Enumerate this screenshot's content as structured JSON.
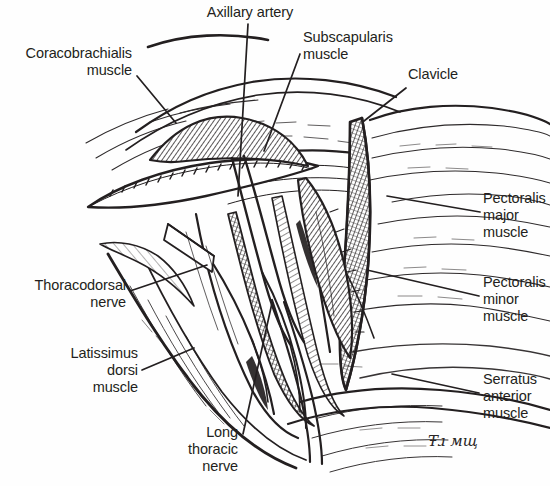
{
  "figure": {
    "type": "line-art-medical-illustration",
    "background_color": "#fefefe",
    "ink_color": "#231f20",
    "width": 550,
    "height": 486
  },
  "labels": [
    {
      "id": "axillary-artery",
      "text": "Axillary artery",
      "align": "center",
      "x": 190,
      "y": 4,
      "width": 120,
      "leader": [
        [
          248,
          24
        ],
        [
          238,
          196
        ]
      ]
    },
    {
      "id": "coracobrachialis-muscle",
      "text": "Coracobrachialis\nmuscle",
      "align": "right",
      "x": 4,
      "y": 45,
      "width": 128,
      "leader": [
        [
          137,
          76
        ],
        [
          176,
          123
        ]
      ]
    },
    {
      "id": "subscapularis-muscle",
      "text": "Subscapularis\nmuscle",
      "align": "left",
      "x": 303,
      "y": 29,
      "width": 110,
      "leader": [
        [
          300,
          54
        ],
        [
          264,
          151
        ]
      ]
    },
    {
      "id": "clavicle",
      "text": "Clavicle",
      "align": "left",
      "x": 408,
      "y": 66,
      "width": 70,
      "leader": [
        [
          406,
          88
        ],
        [
          364,
          121
        ]
      ]
    },
    {
      "id": "pectoralis-major-muscle",
      "text": "Pectoralis\nmajor\nmuscle",
      "align": "left",
      "x": 483,
      "y": 190,
      "width": 70,
      "leader": [
        [
          480,
          212
        ],
        [
          387,
          196
        ]
      ]
    },
    {
      "id": "thoracodorsal-nerve",
      "text": "Thoracodorsal\nnerve",
      "align": "right",
      "x": 4,
      "y": 277,
      "width": 122,
      "leader": [
        [
          130,
          291
        ],
        [
          207,
          265
        ]
      ]
    },
    {
      "id": "pectoralis-minor-muscle",
      "text": "Pectoralis\nminor\nmuscle",
      "align": "left",
      "x": 483,
      "y": 274,
      "width": 68,
      "leader": [
        [
          479,
          296
        ],
        [
          367,
          270
        ]
      ]
    },
    {
      "id": "latissimus-dorsi-muscle",
      "text": "Latissimus\ndorsi\nmuscle",
      "align": "right",
      "x": 18,
      "y": 345,
      "width": 120,
      "leader": [
        [
          142,
          370
        ],
        [
          194,
          348
        ]
      ]
    },
    {
      "id": "serratus-anterior-muscle",
      "text": "Serratus\nanterior\nmuscle",
      "align": "left",
      "x": 483,
      "y": 371,
      "width": 70,
      "leader": [
        [
          479,
          393
        ],
        [
          392,
          374
        ]
      ]
    },
    {
      "id": "long-thoracic-nerve",
      "text": "Long\nthoracic\nnerve",
      "align": "right",
      "x": 140,
      "y": 424,
      "width": 98,
      "leader": [
        [
          243,
          434
        ],
        [
          272,
          303
        ]
      ]
    }
  ],
  "signature": {
    "text": "Ŧɹ мщ",
    "x": 428,
    "y": 432
  }
}
